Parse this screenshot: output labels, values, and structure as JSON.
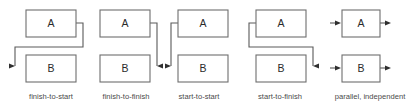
{
  "figure": {
    "background_color": "#ffffff",
    "box_stroke_color": "#6e6e6e",
    "connector_color": "#5a5a5a",
    "arrow_color": "#2f2f2f",
    "caption_color": "#4a4a4a",
    "label_color": "#2b2b2b",
    "width": 420,
    "height": 110
  },
  "groups": [
    {
      "id": "finish-to-start",
      "caption": "finish-to-start",
      "caption_x": 51,
      "caption_y": 97,
      "boxes": [
        {
          "label": "A",
          "x": 26,
          "y": 10,
          "w": 50,
          "h": 27
        },
        {
          "label": "B",
          "x": 26,
          "y": 55,
          "w": 50,
          "h": 27
        }
      ],
      "connector_path": "M 76 23 L 83 23 L 83 47 L 15 47 L 15 66",
      "arrow": {
        "x": 15,
        "y": 66,
        "dir": "right"
      }
    },
    {
      "id": "finish-to-finish",
      "caption": "finish-to-finish",
      "caption_x": 126,
      "caption_y": 97,
      "boxes": [
        {
          "label": "A",
          "x": 100,
          "y": 10,
          "w": 50,
          "h": 27
        },
        {
          "label": "B",
          "x": 100,
          "y": 55,
          "w": 50,
          "h": 27
        }
      ],
      "connector_path": "M 150 23 L 157 23 L 157 66",
      "arrow": {
        "x": 157,
        "y": 66,
        "dir": "left"
      }
    },
    {
      "id": "start-to-start",
      "caption": "start-to-start",
      "caption_x": 199,
      "caption_y": 97,
      "boxes": [
        {
          "label": "A",
          "x": 178,
          "y": 10,
          "w": 50,
          "h": 27
        },
        {
          "label": "B",
          "x": 178,
          "y": 55,
          "w": 50,
          "h": 27
        }
      ],
      "connector_path": "M 178 23 L 171 23 L 171 66",
      "arrow": {
        "x": 171,
        "y": 66,
        "dir": "right"
      }
    },
    {
      "id": "start-to-finish",
      "caption": "start-to-finish",
      "caption_x": 280,
      "caption_y": 97,
      "boxes": [
        {
          "label": "A",
          "x": 256,
          "y": 10,
          "w": 50,
          "h": 27
        },
        {
          "label": "B",
          "x": 256,
          "y": 55,
          "w": 50,
          "h": 27
        }
      ],
      "connector_path": "M 256 23 L 249 23 L 249 47 L 313 47 L 313 66",
      "arrow": {
        "x": 313,
        "y": 66,
        "dir": "left"
      }
    },
    {
      "id": "parallel-independent",
      "caption": "parallel, independent",
      "caption_x": 370,
      "caption_y": 97,
      "boxes": [
        {
          "label": "A",
          "x": 342,
          "y": 10,
          "w": 38,
          "h": 27
        },
        {
          "label": "B",
          "x": 342,
          "y": 55,
          "w": 38,
          "h": 27
        }
      ],
      "stub_arrows": [
        {
          "path": "M 330 23 L 338 23",
          "arrow": {
            "x": 341,
            "y": 23,
            "dir": "right"
          }
        },
        {
          "path": "M 380 23 L 388 23",
          "arrow": {
            "x": 391,
            "y": 23,
            "dir": "right"
          }
        },
        {
          "path": "M 330 68 L 338 68",
          "arrow": {
            "x": 341,
            "y": 68,
            "dir": "right"
          }
        },
        {
          "path": "M 380 68 L 388 68",
          "arrow": {
            "x": 391,
            "y": 68,
            "dir": "right"
          }
        }
      ]
    }
  ]
}
